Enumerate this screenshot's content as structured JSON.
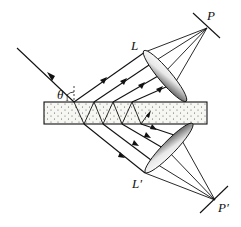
{
  "diagram": {
    "type": "optics-multiple-beam-interference",
    "labels": {
      "lens_top": "L",
      "lens_bottom": "L′",
      "screen_top": "P",
      "screen_bottom": "P′",
      "angle": "θ",
      "angle_sub": "1"
    },
    "colors": {
      "line": "#111111",
      "slab_fill": "#f4f4f0",
      "slab_dots": "#555555",
      "lens_light": "#ffffff",
      "lens_dark": "#6a6a6a"
    },
    "elements": [
      "incident-ray",
      "plane-parallel-plate",
      "reflected-rays (4)",
      "transmitted-rays (4)",
      "converging-lens-L",
      "converging-lens-L-prime",
      "screen-P",
      "screen-P-prime"
    ]
  }
}
